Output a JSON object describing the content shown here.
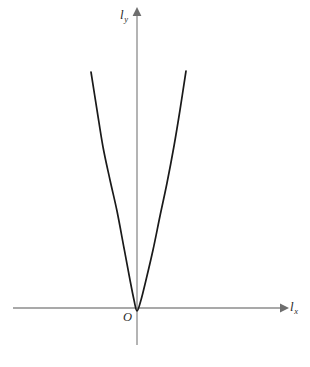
{
  "figure": {
    "background_color": "#ffffff",
    "width": 310,
    "height": 367
  },
  "labels": {
    "y_axis_symbol": "l",
    "y_axis_subscript": "y",
    "x_axis_symbol": "l",
    "x_axis_subscript": "x",
    "origin": "O"
  },
  "colors": {
    "axis": "#8c8c8c",
    "arrow": "#6e6e6e",
    "curve": "#1a1a1a",
    "text": "#2b2b2b"
  },
  "chart_data": {
    "type": "line",
    "title": "",
    "xlabel": "l_x",
    "ylabel": "l_y",
    "grid": false,
    "legend": "none",
    "axes": {
      "x_axis": {
        "pixel_y": 308,
        "pixel_x_start": 13,
        "pixel_x_end": 283,
        "arrow": "right",
        "ticks": [],
        "tick_labels": []
      },
      "y_axis": {
        "pixel_x": 137,
        "pixel_y_start": 345,
        "pixel_y_end": 12,
        "arrow": "up",
        "ticks": [],
        "tick_labels": []
      }
    },
    "series": [
      {
        "name": "parabola",
        "color": "#1a1a1a",
        "points": [
          [
            91,
            72
          ],
          [
            97,
            110
          ],
          [
            103,
            147
          ],
          [
            110,
            180
          ],
          [
            117,
            211
          ],
          [
            124,
            248
          ],
          [
            130,
            280
          ],
          [
            134,
            300
          ],
          [
            137,
            311
          ],
          [
            141,
            300
          ],
          [
            146,
            280
          ],
          [
            153,
            250
          ],
          [
            160,
            216
          ],
          [
            167,
            183
          ],
          [
            174,
            146
          ],
          [
            180,
            110
          ],
          [
            186,
            71
          ]
        ]
      }
    ],
    "vertex": [
      137,
      311
    ],
    "opens": "up"
  }
}
